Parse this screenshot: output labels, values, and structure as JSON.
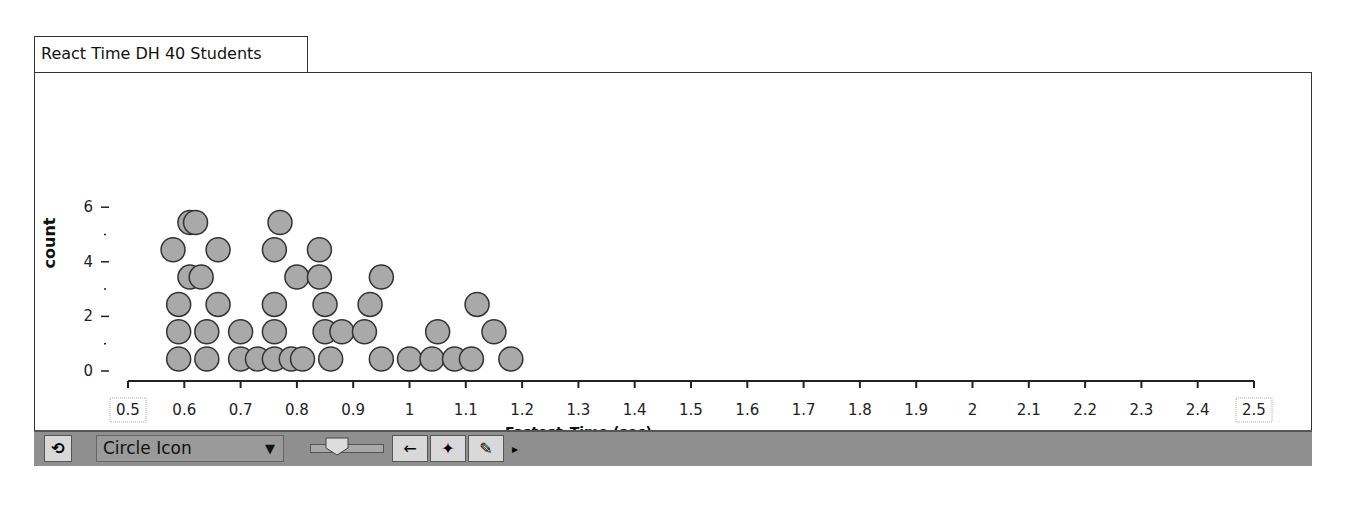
{
  "window": {
    "title": "React Time DH 40 Students"
  },
  "toolbar": {
    "refresh_icon": "rotate-arrows-icon",
    "icon_style": "Circle Icon",
    "dropdown_arrow": "▼",
    "back_icon": "←",
    "crosshair_icon": "✦",
    "pencil_icon": "✎",
    "more_icon": "▸"
  },
  "chart_data": {
    "type": "scatter",
    "subtype": "dot plot",
    "title": "React Time DH 40 Students",
    "xlabel": "Fastest_Time (sec)",
    "ylabel": "count",
    "xlim": [
      0.5,
      2.5
    ],
    "ylim": [
      0,
      6
    ],
    "x_ticks": [
      "0.5",
      "0.6",
      "0.7",
      "0.8",
      "0.9",
      "1",
      "1.1",
      "1.2",
      "1.3",
      "1.4",
      "1.5",
      "1.6",
      "1.7",
      "1.8",
      "1.9",
      "2",
      "2.1",
      "2.2",
      "2.3",
      "2.4",
      "2.5"
    ],
    "y_ticks": [
      "0",
      "2",
      "4",
      "6"
    ],
    "points": [
      {
        "x": 0.59,
        "y": 0
      },
      {
        "x": 0.59,
        "y": 1
      },
      {
        "x": 0.59,
        "y": 2
      },
      {
        "x": 0.58,
        "y": 4
      },
      {
        "x": 0.61,
        "y": 3
      },
      {
        "x": 0.61,
        "y": 5
      },
      {
        "x": 0.62,
        "y": 5
      },
      {
        "x": 0.63,
        "y": 3
      },
      {
        "x": 0.64,
        "y": 0
      },
      {
        "x": 0.64,
        "y": 1
      },
      {
        "x": 0.66,
        "y": 2
      },
      {
        "x": 0.66,
        "y": 4
      },
      {
        "x": 0.7,
        "y": 0
      },
      {
        "x": 0.7,
        "y": 1
      },
      {
        "x": 0.73,
        "y": 0
      },
      {
        "x": 0.76,
        "y": 0
      },
      {
        "x": 0.76,
        "y": 1
      },
      {
        "x": 0.76,
        "y": 2
      },
      {
        "x": 0.76,
        "y": 4
      },
      {
        "x": 0.77,
        "y": 5
      },
      {
        "x": 0.79,
        "y": 0
      },
      {
        "x": 0.8,
        "y": 3
      },
      {
        "x": 0.81,
        "y": 0
      },
      {
        "x": 0.84,
        "y": 3
      },
      {
        "x": 0.84,
        "y": 4
      },
      {
        "x": 0.85,
        "y": 1
      },
      {
        "x": 0.85,
        "y": 2
      },
      {
        "x": 0.86,
        "y": 0
      },
      {
        "x": 0.88,
        "y": 1
      },
      {
        "x": 0.92,
        "y": 1
      },
      {
        "x": 0.93,
        "y": 2
      },
      {
        "x": 0.95,
        "y": 3
      },
      {
        "x": 0.95,
        "y": 0
      },
      {
        "x": 1.0,
        "y": 0
      },
      {
        "x": 1.04,
        "y": 0
      },
      {
        "x": 1.05,
        "y": 1
      },
      {
        "x": 1.08,
        "y": 0
      },
      {
        "x": 1.11,
        "y": 0
      },
      {
        "x": 1.12,
        "y": 2
      },
      {
        "x": 1.15,
        "y": 1
      },
      {
        "x": 1.18,
        "y": 0
      }
    ]
  }
}
